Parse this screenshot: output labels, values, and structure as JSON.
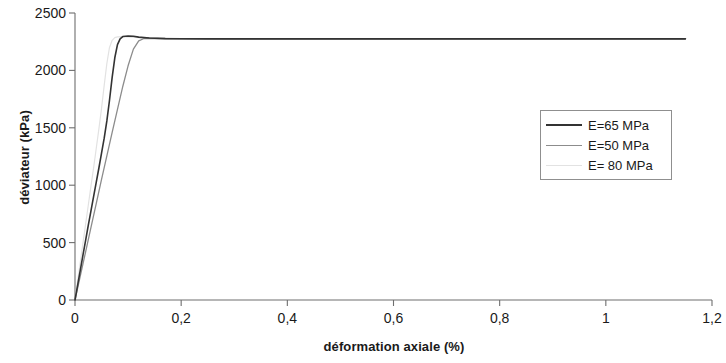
{
  "chart_data": {
    "type": "line",
    "title": "",
    "xlabel": "déformation axiale (%)",
    "ylabel": "déviateur (kPa)",
    "xlim": [
      0,
      1.2
    ],
    "ylim": [
      0,
      2500
    ],
    "xticks": [
      "0",
      "0,2",
      "0,4",
      "0,6",
      "0,8",
      "1",
      "1,2"
    ],
    "xtick_values": [
      0,
      0.2,
      0.4,
      0.6,
      0.8,
      1.0,
      1.2
    ],
    "yticks": [
      "0",
      "500",
      "1000",
      "1500",
      "2000",
      "2500"
    ],
    "ytick_values": [
      0,
      500,
      1000,
      1500,
      2000,
      2500
    ],
    "grid": false,
    "legend_position": "center-right",
    "series": [
      {
        "name": "E=65 MPa",
        "color": "#333333",
        "width": 1.6,
        "points": [
          [
            0.0,
            0
          ],
          [
            0.005,
            130
          ],
          [
            0.01,
            260
          ],
          [
            0.015,
            390
          ],
          [
            0.02,
            520
          ],
          [
            0.025,
            650
          ],
          [
            0.03,
            775
          ],
          [
            0.035,
            900
          ],
          [
            0.04,
            1025
          ],
          [
            0.045,
            1150
          ],
          [
            0.05,
            1280
          ],
          [
            0.055,
            1410
          ],
          [
            0.06,
            1560
          ],
          [
            0.065,
            1740
          ],
          [
            0.07,
            1940
          ],
          [
            0.075,
            2110
          ],
          [
            0.08,
            2225
          ],
          [
            0.085,
            2275
          ],
          [
            0.09,
            2295
          ],
          [
            0.1,
            2300
          ],
          [
            0.11,
            2297
          ],
          [
            0.12,
            2290
          ],
          [
            0.14,
            2282
          ],
          [
            0.17,
            2277
          ],
          [
            0.25,
            2275
          ],
          [
            0.5,
            2275
          ],
          [
            0.8,
            2275
          ],
          [
            1.0,
            2275
          ],
          [
            1.15,
            2275
          ]
        ]
      },
      {
        "name": "E=50 MPa",
        "color": "#8c8c8c",
        "width": 1.3,
        "points": [
          [
            0.0,
            0
          ],
          [
            0.01,
            210
          ],
          [
            0.02,
            420
          ],
          [
            0.03,
            630
          ],
          [
            0.04,
            840
          ],
          [
            0.05,
            1050
          ],
          [
            0.06,
            1255
          ],
          [
            0.07,
            1460
          ],
          [
            0.08,
            1660
          ],
          [
            0.09,
            1860
          ],
          [
            0.1,
            2040
          ],
          [
            0.11,
            2185
          ],
          [
            0.12,
            2258
          ],
          [
            0.13,
            2278
          ],
          [
            0.14,
            2280
          ],
          [
            0.16,
            2278
          ],
          [
            0.2,
            2276
          ],
          [
            0.3,
            2275
          ],
          [
            0.6,
            2275
          ],
          [
            0.9,
            2275
          ],
          [
            1.15,
            2275
          ]
        ]
      },
      {
        "name": "E= 80 MPa",
        "color": "#e2e2e2",
        "width": 1.2,
        "points": [
          [
            0.0,
            0
          ],
          [
            0.005,
            165
          ],
          [
            0.01,
            330
          ],
          [
            0.015,
            495
          ],
          [
            0.02,
            660
          ],
          [
            0.025,
            825
          ],
          [
            0.03,
            990
          ],
          [
            0.035,
            1150
          ],
          [
            0.04,
            1320
          ],
          [
            0.045,
            1490
          ],
          [
            0.05,
            1670
          ],
          [
            0.055,
            1870
          ],
          [
            0.06,
            2060
          ],
          [
            0.065,
            2200
          ],
          [
            0.07,
            2262
          ],
          [
            0.075,
            2285
          ],
          [
            0.08,
            2292
          ],
          [
            0.09,
            2294
          ],
          [
            0.1,
            2292
          ],
          [
            0.12,
            2285
          ],
          [
            0.15,
            2278
          ],
          [
            0.22,
            2275
          ],
          [
            0.5,
            2275
          ],
          [
            0.9,
            2275
          ],
          [
            1.15,
            2275
          ]
        ]
      }
    ],
    "axis_color": "#6e6e6e",
    "background": "#ffffff"
  }
}
